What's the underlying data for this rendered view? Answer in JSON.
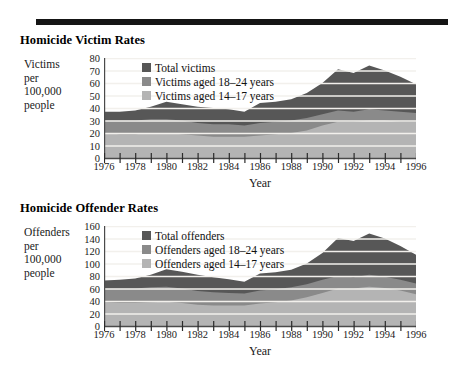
{
  "figure": {
    "background_color": "#ffffff",
    "panel_background_color": "#eceae6",
    "rule_color": "#151515"
  },
  "colors": {
    "total": "#575757",
    "aged_18_24": "#8a8a8a",
    "aged_14_17": "#b4b4b4",
    "gridline": "#f2f0ec",
    "axis": "#4a4a4a",
    "text": "#1a1a1a"
  },
  "panels": [
    {
      "id": "victims",
      "title": "Homicide Victim Rates",
      "y_axis_label_lines": [
        "Victims",
        "per",
        "100,000",
        "people"
      ],
      "x_axis_title": "Year",
      "legend": [
        {
          "label": "Total victims",
          "color_key": "total"
        },
        {
          "label": "Victims aged 18–24 years",
          "color_key": "aged_18_24"
        },
        {
          "label": "Victims aged 14–17 years",
          "color_key": "aged_14_17"
        }
      ],
      "y_ticks": [
        0,
        10,
        20,
        30,
        40,
        50,
        60,
        70,
        80
      ],
      "x_ticks_labeled": [
        1976,
        1978,
        1980,
        1982,
        1984,
        1986,
        1988,
        1990,
        1992,
        1994,
        1996
      ]
    },
    {
      "id": "offenders",
      "title": "Homicide Offender Rates",
      "y_axis_label_lines": [
        "Offenders",
        "per",
        "100,000",
        "people"
      ],
      "x_axis_title": "Year",
      "legend": [
        {
          "label": "Total offenders",
          "color_key": "total"
        },
        {
          "label": "Offenders aged 18–24 years",
          "color_key": "aged_18_24"
        },
        {
          "label": "Offenders aged 14–17 years",
          "color_key": "aged_14_17"
        }
      ],
      "y_ticks": [
        0,
        20,
        40,
        60,
        80,
        100,
        120,
        140,
        160
      ],
      "x_ticks_labeled": [
        1976,
        1978,
        1980,
        1982,
        1984,
        1986,
        1988,
        1990,
        1992,
        1994,
        1996
      ]
    }
  ],
  "chart_data": [
    {
      "type": "area",
      "id": "victims",
      "title": "Homicide Victim Rates",
      "xlabel": "Year",
      "ylabel": "Victims per 100,000 people",
      "stacked": false,
      "grid": true,
      "legend_position": "inside-top-left",
      "xlim": [
        1976,
        1996
      ],
      "ylim": [
        0,
        80
      ],
      "x": [
        1976,
        1977,
        1978,
        1979,
        1980,
        1981,
        1982,
        1983,
        1984,
        1985,
        1986,
        1987,
        1988,
        1989,
        1990,
        1991,
        1992,
        1993,
        1994,
        1995,
        1996
      ],
      "series": [
        {
          "name": "Total victims",
          "color": "#575757",
          "values": [
            37,
            37,
            38,
            41,
            45,
            43,
            41,
            40,
            39,
            37,
            44,
            45,
            47,
            52,
            60,
            71,
            68,
            74,
            70,
            65,
            59
          ]
        },
        {
          "name": "Victims aged 18–24 years",
          "color": "#8a8a8a",
          "values": [
            30,
            30,
            30,
            31,
            31,
            30,
            28,
            27,
            27,
            26,
            28,
            29,
            30,
            32,
            35,
            38,
            37,
            39,
            38,
            37,
            36
          ]
        },
        {
          "name": "Victims aged 14–17 years",
          "color": "#b4b4b4",
          "values": [
            20,
            19,
            19,
            20,
            20,
            19,
            18,
            17,
            17,
            17,
            18,
            19,
            20,
            22,
            26,
            29,
            29,
            30,
            30,
            29,
            29
          ]
        }
      ]
    },
    {
      "type": "area",
      "id": "offenders",
      "title": "Homicide Offender Rates",
      "xlabel": "Year",
      "ylabel": "Offenders per 100,000 people",
      "stacked": false,
      "grid": true,
      "legend_position": "inside-top-left",
      "xlim": [
        1976,
        1996
      ],
      "ylim": [
        0,
        160
      ],
      "x": [
        1976,
        1977,
        1978,
        1979,
        1980,
        1981,
        1982,
        1983,
        1984,
        1985,
        1986,
        1987,
        1988,
        1989,
        1990,
        1991,
        1992,
        1993,
        1994,
        1995,
        1996
      ],
      "series": [
        {
          "name": "Total offenders",
          "color": "#575757",
          "values": [
            73,
            74,
            76,
            82,
            91,
            87,
            82,
            78,
            75,
            71,
            84,
            86,
            90,
            100,
            117,
            141,
            136,
            148,
            140,
            128,
            114
          ]
        },
        {
          "name": "Offenders aged 18–24 years",
          "color": "#8a8a8a",
          "values": [
            60,
            60,
            60,
            62,
            63,
            60,
            56,
            54,
            53,
            52,
            57,
            59,
            62,
            67,
            74,
            80,
            78,
            82,
            79,
            74,
            68
          ]
        },
        {
          "name": "Offenders aged 14–17 years",
          "color": "#b4b4b4",
          "values": [
            38,
            37,
            37,
            38,
            39,
            37,
            34,
            33,
            33,
            33,
            36,
            38,
            41,
            46,
            53,
            60,
            60,
            63,
            61,
            57,
            51
          ]
        }
      ]
    }
  ]
}
